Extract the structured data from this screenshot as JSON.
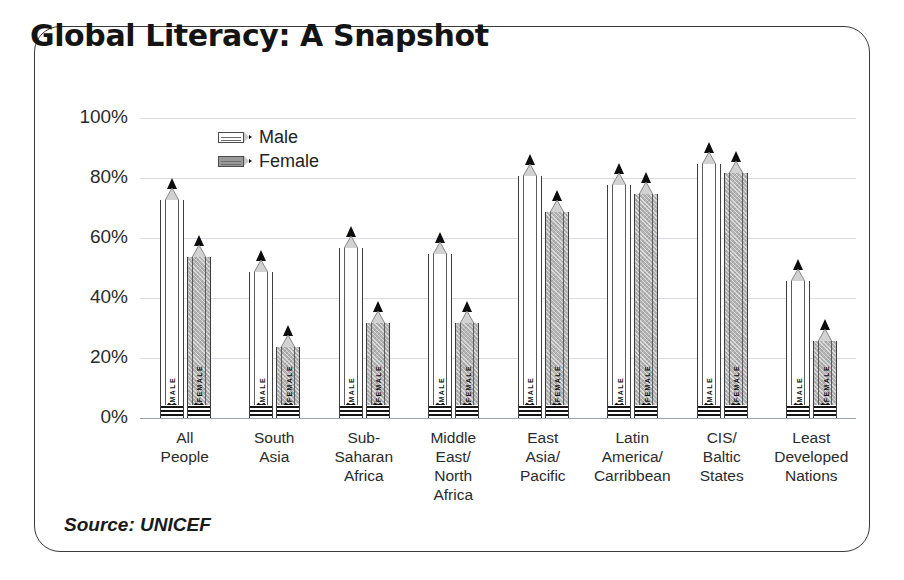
{
  "title": "Global Literacy: A Snapshot",
  "source": "Source:  UNICEF",
  "legend": [
    {
      "key": "male",
      "label": "Male",
      "swatch": "pencil-outline-icon"
    },
    {
      "key": "female",
      "label": "Female",
      "swatch": "pencil-hatched-icon"
    }
  ],
  "shaft_labels": {
    "male": "MALE",
    "female": "FEMALE"
  },
  "axis": {
    "y_ticks": [
      "100%",
      "80%",
      "60%",
      "40%",
      "20%",
      "0%"
    ]
  },
  "chart_data": {
    "type": "bar",
    "title": "Global Literacy: A Snapshot",
    "xlabel": "",
    "ylabel": "",
    "ylim": [
      0,
      100
    ],
    "ytick_values": [
      0,
      20,
      40,
      60,
      80,
      100
    ],
    "grid": true,
    "legend_position": "top-center",
    "units": "percent",
    "categories": [
      "All\nPeople",
      "South\nAsia",
      "Sub-\nSaharan\nAfrica",
      "Middle\nEast/\nNorth\nAfrica",
      "East\nAsia/\nPacific",
      "Latin\nAmerica/\nCarribbean",
      "CIS/\nBaltic\nStates",
      "Least\nDeveloped\nNations"
    ],
    "category_lines": [
      [
        "All",
        "People"
      ],
      [
        "South",
        "Asia"
      ],
      [
        "Sub-",
        "Saharan",
        "Africa"
      ],
      [
        "Middle",
        "East/",
        "North",
        "Africa"
      ],
      [
        "East",
        "Asia/",
        "Pacific"
      ],
      [
        "Latin",
        "America/",
        "Carribbean"
      ],
      [
        "CIS/",
        "Baltic",
        "States"
      ],
      [
        "Least",
        "Developed",
        "Nations"
      ]
    ],
    "series": [
      {
        "name": "Male",
        "values": [
          80,
          56,
          64,
          62,
          88,
          85,
          92,
          53
        ]
      },
      {
        "name": "Female",
        "values": [
          61,
          31,
          39,
          39,
          76,
          82,
          89,
          33
        ]
      }
    ]
  }
}
